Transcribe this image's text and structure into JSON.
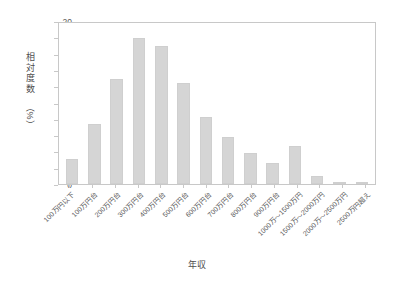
{
  "chart_data": {
    "type": "bar",
    "title": "",
    "xlabel": "年収",
    "ylabel": "相対度数（%）",
    "ylabel_chars": [
      "相",
      "対",
      "度",
      "数"
    ],
    "ylabel_unit": "（%）",
    "ylim": [
      0,
      20
    ],
    "ytick_step": 2,
    "yticks": [
      "0",
      "2",
      "4",
      "6",
      "8",
      "10",
      "12",
      "14",
      "16",
      "18",
      "20"
    ],
    "grid": false,
    "legend": "none",
    "bar_color": "#d5d5d5",
    "bar_edge_color": "#cfcfcf",
    "axis_color": "#c8c8c8",
    "categories": [
      "100万円以下",
      "100万円台",
      "200万円台",
      "300万円台",
      "400万円台",
      "500万円台",
      "600万円台",
      "700万円台",
      "800万円台",
      "900万円台",
      "1000万～1500万円",
      "1500万～2000万円",
      "2000万～2500万円",
      "2500万円超え"
    ],
    "values": [
      3.1,
      7.4,
      13.1,
      18.1,
      17.2,
      12.6,
      8.3,
      5.8,
      3.8,
      2.55,
      4.7,
      0.95,
      0.15,
      0.3
    ]
  }
}
